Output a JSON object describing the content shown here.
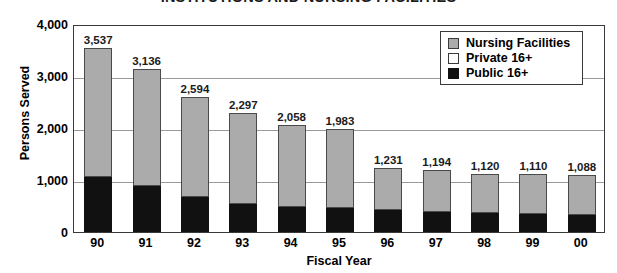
{
  "chart_data": {
    "type": "bar",
    "subtype": "stacked",
    "title": "INSTITUTIONS AND NURSING FACILITIES",
    "xlabel": "Fiscal Year",
    "ylabel": "Persons Served",
    "categories": [
      "90",
      "91",
      "92",
      "93",
      "94",
      "95",
      "96",
      "97",
      "98",
      "99",
      "00"
    ],
    "ylim": [
      0,
      4000
    ],
    "yticks": [
      0,
      1000,
      2000,
      3000,
      4000
    ],
    "ytick_labels": [
      "0",
      "1,000",
      "2,000",
      "3,000",
      "4,000"
    ],
    "grid": true,
    "legend_position": "top-right",
    "totals": [
      3537,
      3136,
      2594,
      2297,
      2058,
      1983,
      1231,
      1194,
      1120,
      1110,
      1088
    ],
    "total_labels": [
      "3,537",
      "3,136",
      "2,594",
      "2,297",
      "2,058",
      "1,983",
      "1,231",
      "1,194",
      "1,120",
      "1,110",
      "1,088"
    ],
    "series": [
      {
        "name": "Public 16+",
        "color": "#111111",
        "values": [
          1060,
          890,
          670,
          530,
          490,
          460,
          420,
          390,
          370,
          350,
          320
        ]
      },
      {
        "name": "Private 16+",
        "color": "#ffffff",
        "values": [
          0,
          0,
          0,
          0,
          0,
          0,
          0,
          0,
          0,
          0,
          0
        ]
      },
      {
        "name": "Nursing Facilities",
        "color": "#ababab",
        "values": [
          2477,
          2246,
          1924,
          1767,
          1568,
          1523,
          811,
          804,
          750,
          760,
          768
        ]
      }
    ]
  },
  "legend": {
    "items": [
      {
        "label": "Nursing Facilities",
        "swatch": "nursing"
      },
      {
        "label": "Private 16+",
        "swatch": "private"
      },
      {
        "label": "Public 16+",
        "swatch": "public"
      }
    ]
  },
  "colors": {
    "nursing": "#ababab",
    "private": "#ffffff",
    "public": "#111111",
    "frame": "#3a3a3a",
    "gridline": "#9a9a9a",
    "text": "#1b1b1b"
  }
}
